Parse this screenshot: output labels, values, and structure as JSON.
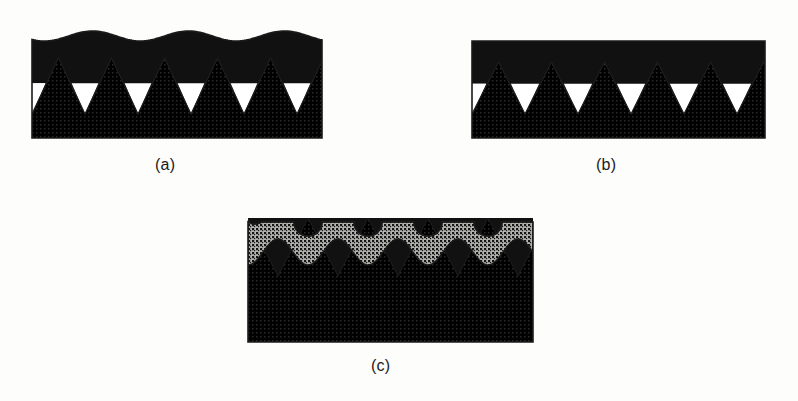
{
  "figure": {
    "background_color": "#fdfdfb",
    "ink_color": "#111111",
    "outline_color": "#1b1b1b",
    "substrate_fill_color": "#e9e9e4",
    "substrate_dot_color": "#2a2a2a",
    "top_layer_fill_color": "#9a9a96",
    "top_layer_dot_color": "#171717",
    "void_color": "#ffffff"
  },
  "panels": [
    {
      "id": "a",
      "caption": "(a)",
      "frame": {
        "x": 32,
        "y": 30,
        "width": 290,
        "height": 108
      },
      "description": "V-grooved substrate with thick dark coating having a wavy upper surface and white voids trapped at groove bottoms",
      "groove": {
        "count": 5.5,
        "period": 53,
        "depth": 56,
        "crest_y": 58,
        "void": true,
        "void_fill": "#ffffff",
        "void_top_fraction": 0.55
      },
      "coating": {
        "fill": "#111111",
        "top_surface": "wavy",
        "wave_amplitude": 5,
        "wave_period": 96,
        "base_top_y": 36,
        "bottom_y": 58
      }
    },
    {
      "id": "b",
      "caption": "(b)",
      "frame": {
        "x": 472,
        "y": 38,
        "width": 293,
        "height": 100
      },
      "description": "Same V-grooved substrate with a thinner dark coating having a flat upper surface and white voids at groove bottoms",
      "groove": {
        "count": 5.5,
        "period": 53,
        "depth": 52,
        "crest_y": 62,
        "void": true,
        "void_fill": "#ffffff",
        "void_top_fraction": 0.58
      },
      "coating": {
        "fill": "#111111",
        "top_surface": "flat",
        "wave_amplitude": 0,
        "wave_period": 0,
        "base_top_y": 41,
        "bottom_y": 62
      }
    },
    {
      "id": "c",
      "caption": "(c)",
      "frame": {
        "x": 248,
        "y": 218,
        "width": 285,
        "height": 124
      },
      "description": "Scalloped dark-stippled top layer over a continuous black interlayer, with V-grooves of the substrate completely filled by the black phase",
      "groove": {
        "count": 4.5,
        "period": 60,
        "depth": 58,
        "crest_y": 276,
        "void": false,
        "void_fill": "",
        "void_top_fraction": 0
      },
      "coating": {
        "fill": "#111111",
        "top_surface": "scalloped",
        "wave_amplitude": 0,
        "wave_period": 60,
        "base_top_y": 218,
        "bottom_y": 276
      },
      "scallop": {
        "count": 4,
        "radius": 14,
        "period": 60,
        "notch_center_y": 222,
        "lower_wave_y": 252,
        "lower_wave_amplitude": 13
      }
    }
  ]
}
